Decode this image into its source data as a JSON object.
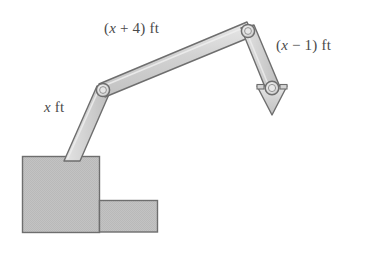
{
  "figure": {
    "background_color": "#ffffff",
    "width": 373,
    "height": 253
  },
  "colors": {
    "outline": "#6e6e6e",
    "arm_fill": "#cfcfcf",
    "arm_highlight": "#e2e2e2",
    "base_fill": "#bfbfbf",
    "joint_fill": "#dcdcdc",
    "label_text": "#4a4a4a"
  },
  "labels": {
    "lower_arm": {
      "expression": "x",
      "suffix": " ft",
      "full": "x ft"
    },
    "upper_arm": {
      "prefix": "(",
      "expression": "x",
      "operator": " + ",
      "constant": "4",
      "suffix": ") ft",
      "full": "(x + 4) ft"
    },
    "tool_arm": {
      "prefix": "(",
      "expression": "x",
      "operator": " − ",
      "constant": "1",
      "suffix": ") ft",
      "full": "(x − 1) ft"
    }
  },
  "parts": [
    {
      "name": "base-block-large",
      "shape": "rectangle",
      "x": 22,
      "y": 156,
      "width": 77,
      "height": 76
    },
    {
      "name": "base-block-small",
      "shape": "rectangle",
      "x": 99,
      "y": 200,
      "width": 59,
      "height": 32
    },
    {
      "name": "lower-arm-segment",
      "shape": "beam",
      "from": [
        72,
        160
      ],
      "to": [
        103,
        90
      ],
      "label": "x ft"
    },
    {
      "name": "upper-arm-segment",
      "shape": "beam",
      "from": [
        103,
        90
      ],
      "to": [
        248,
        31
      ],
      "label": "(x + 4) ft"
    },
    {
      "name": "tool-arm-segment",
      "shape": "beam",
      "from": [
        248,
        31
      ],
      "to": [
        272,
        89
      ],
      "label": "(x − 1) ft"
    },
    {
      "name": "elbow-joint",
      "shape": "circle",
      "cx": 103,
      "cy": 90,
      "r": 6.5
    },
    {
      "name": "shoulder-joint",
      "shape": "circle",
      "cx": 248,
      "cy": 31,
      "r": 6.5
    },
    {
      "name": "wrist-joint",
      "shape": "circle",
      "cx": 272,
      "cy": 89,
      "r": 6.5
    },
    {
      "name": "bucket-arrowhead",
      "shape": "triangle-down",
      "apex": [
        272,
        114
      ],
      "width": 30
    }
  ]
}
